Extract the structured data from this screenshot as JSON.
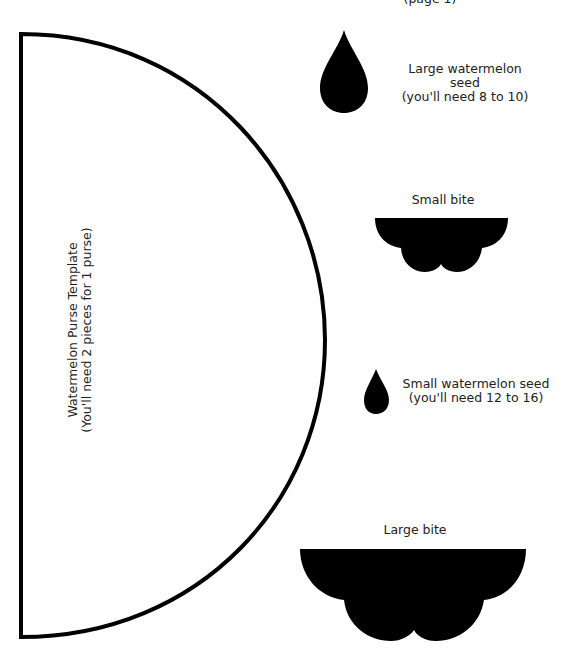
{
  "page": {
    "header_fragment": "(page 1)",
    "background": "#ffffff",
    "ink_color": "#000000"
  },
  "template": {
    "title": "Watermelon Purse Template",
    "note": "(You'll need 2 pieces for 1 purse)",
    "shape": "semicircle-outline"
  },
  "pieces": [
    {
      "id": "large-seed",
      "label_line1": "Large watermelon",
      "label_line2": "seed",
      "label_line3": "(you'll need 8 to 10)",
      "shape": "teardrop"
    },
    {
      "id": "small-bite",
      "label_line1": "Small bite",
      "shape": "scalloped-bite"
    },
    {
      "id": "small-seed",
      "label_line1": "Small watermelon seed",
      "label_line2": "(you'll need 12 to 16)",
      "shape": "teardrop"
    },
    {
      "id": "large-bite",
      "label_line1": "Large bite",
      "shape": "scalloped-bite"
    }
  ]
}
